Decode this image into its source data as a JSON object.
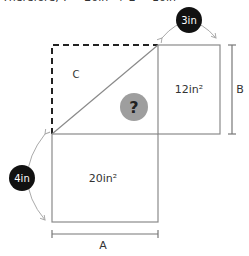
{
  "caption": "Therefore, ? = 20in² + 2 = 10in²",
  "diagram": {
    "regions": {
      "top_left_label": "C",
      "unknown_marker": "?",
      "right_area": "12in²",
      "bottom_area": "20in²"
    },
    "dimensions": {
      "bottom_width": "A",
      "right_height": "B"
    },
    "badges": {
      "top": "3in",
      "left": "4in"
    },
    "colors": {
      "line": "#8a8a8a",
      "dashed": "#222222",
      "badge": "#111111",
      "badge_text": "#ffffff",
      "unknown_fill": "#9e9e9e"
    }
  }
}
